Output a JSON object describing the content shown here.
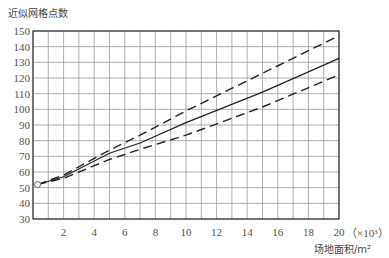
{
  "chart_data": {
    "type": "line",
    "title": "",
    "ylabel": "近似网格点数",
    "xlabel": "场地面积/m²",
    "x_unit_note": "（×10³）",
    "xlim": [
      0,
      20
    ],
    "ylim": [
      30,
      150
    ],
    "x_ticks": [
      2,
      4,
      6,
      8,
      10,
      12,
      14,
      16,
      18,
      20
    ],
    "y_ticks": [
      30,
      40,
      50,
      60,
      70,
      80,
      90,
      100,
      110,
      120,
      130,
      140,
      150
    ],
    "grid": true,
    "grid_x_step": 1,
    "grid_y_step": 10,
    "start_point": {
      "x": 0.3,
      "y": 52,
      "marker": "open-circle"
    },
    "series": [
      {
        "name": "upper bound",
        "style": "dashed",
        "x": [
          0.3,
          2,
          5,
          7,
          10,
          15,
          20
        ],
        "values": [
          52,
          58,
          74,
          83.5,
          99,
          123,
          147
        ]
      },
      {
        "name": "approximation",
        "style": "solid",
        "x": [
          0.3,
          2,
          5,
          7,
          10,
          15,
          20
        ],
        "values": [
          52,
          57,
          72,
          78.5,
          91.5,
          111,
          132.5
        ]
      },
      {
        "name": "lower bound",
        "style": "dashed",
        "x": [
          0.3,
          2,
          5,
          7,
          10,
          15,
          20
        ],
        "values": [
          52,
          56,
          68,
          74.5,
          83.5,
          101.5,
          122
        ]
      }
    ],
    "legend": null
  }
}
